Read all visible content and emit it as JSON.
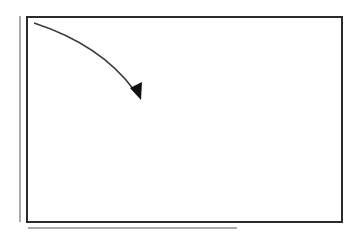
{
  "diagram": {
    "colors": {
      "frame": "#2b2b2b",
      "shadow": "#a9a9a9",
      "arrow": "#3a3a3a",
      "arrowhead": "#111111",
      "background": "#ffffff"
    },
    "frame": {
      "x": 26,
      "y": 16,
      "width": 315,
      "height": 205
    },
    "shadow_lines": {
      "vertical": {
        "x": 19,
        "y1": 16,
        "y2": 222
      },
      "horizontal": {
        "y": 227,
        "x1": 28,
        "x2": 237
      }
    },
    "arrow": {
      "start": [
        34,
        23
      ],
      "control1": [
        80,
        38
      ],
      "control2": [
        118,
        66
      ],
      "end": [
        138,
        96
      ],
      "direction": "down-right curve"
    }
  }
}
